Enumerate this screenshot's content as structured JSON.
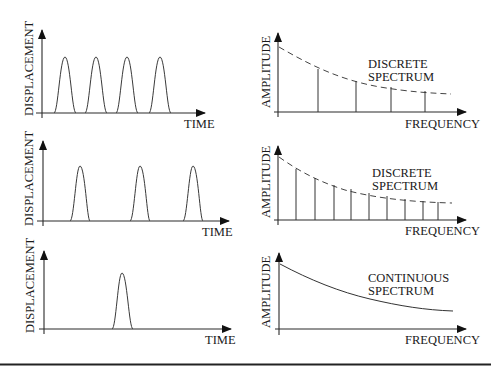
{
  "panels": [
    {
      "id": "row1",
      "time_plot": {
        "ylabel": "DISPLACEMENT",
        "xlabel": "TIME",
        "pulse_count": 4
      },
      "spectrum_plot": {
        "ylabel": "AMPLITUDE",
        "xlabel": "FREQUENCY",
        "label_line1": "DISCRETE",
        "label_line2": "SPECTRUM",
        "type": "discrete",
        "line_count": 4
      }
    },
    {
      "id": "row2",
      "time_plot": {
        "ylabel": "DISPLACEMENT",
        "xlabel": "TIME",
        "pulse_count": 3
      },
      "spectrum_plot": {
        "ylabel": "AMPLITUDE",
        "xlabel": "FREQUENCY",
        "label_line1": "DISCRETE",
        "label_line2": "SPECTRUM",
        "type": "discrete",
        "line_count": 9
      }
    },
    {
      "id": "row3",
      "time_plot": {
        "ylabel": "DISPLACEMENT",
        "xlabel": "TIME",
        "pulse_count": 1
      },
      "spectrum_plot": {
        "ylabel": "AMPLITUDE",
        "xlabel": "FREQUENCY",
        "label_line1": "CONTINUOUS",
        "label_line2": "SPECTRUM",
        "type": "continuous"
      }
    }
  ]
}
